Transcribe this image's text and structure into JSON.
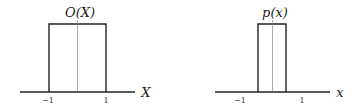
{
  "diagrams": [
    {
      "title": "O(X)",
      "axis_label": "X",
      "tick_labels": [
        "−1",
        "1"
      ],
      "box_range": [
        -1,
        1
      ],
      "shape": "rectangular pulse"
    },
    {
      "title": "p(x)",
      "axis_label": "x",
      "tick_labels": [
        "−1",
        "1"
      ],
      "box_range": [
        -0.5,
        0.5
      ],
      "shape": "rectangular pulse"
    }
  ]
}
